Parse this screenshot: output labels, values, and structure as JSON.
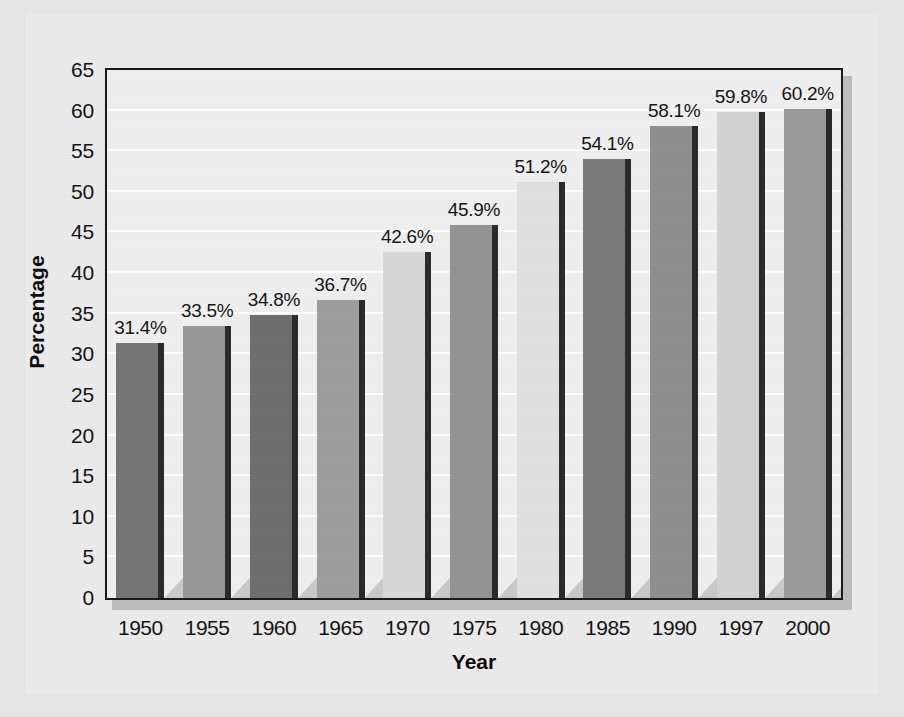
{
  "chart_data": {
    "type": "bar",
    "title": "",
    "xlabel": "Year",
    "ylabel": "Percentage",
    "categories": [
      "1950",
      "1955",
      "1960",
      "1965",
      "1970",
      "1975",
      "1980",
      "1985",
      "1990",
      "1997",
      "2000"
    ],
    "values": [
      31.4,
      33.5,
      34.8,
      36.7,
      42.6,
      45.9,
      51.2,
      54.1,
      58.1,
      59.8,
      60.2
    ],
    "data_labels": [
      "31.4%",
      "33.5%",
      "34.8%",
      "36.7%",
      "42.6%",
      "45.9%",
      "51.2%",
      "54.1%",
      "58.1%",
      "59.8%",
      "60.2%"
    ],
    "ylim": [
      0,
      65
    ],
    "ytick_labels": [
      "65",
      "60",
      "55",
      "50",
      "45",
      "40",
      "35",
      "30",
      "25",
      "20",
      "15",
      "10",
      "5",
      "0"
    ],
    "ytick_values": [
      65,
      60,
      55,
      50,
      45,
      40,
      35,
      30,
      25,
      20,
      15,
      10,
      5,
      0
    ],
    "ytick_step": 5,
    "grid": "horizontal",
    "gridline_color": "#fdfdfd",
    "legend": "none",
    "bar_colors": [
      "#757575",
      "#9a9a9a",
      "#6f6f6f",
      "#9e9e9e",
      "#d8d8d8",
      "#949494",
      "#e0e0e0",
      "#7a7a7a",
      "#8f8f8f",
      "#d2d2d2",
      "#9c9c9c"
    ],
    "bar_edge_color": "#2b2b2b",
    "bar_shadow_color": "#c9c9c9",
    "plot_background": "#efefef",
    "frame_color": "#1a1a1a",
    "page_background": "#ebebeb",
    "axis_text_color": "#141414"
  }
}
